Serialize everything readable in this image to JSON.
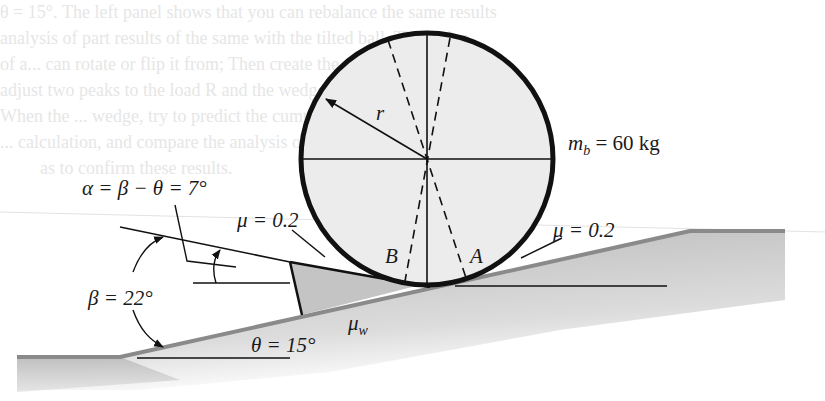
{
  "figure": {
    "ball": {
      "radius_label": "r",
      "mass_label_var": "m",
      "mass_label_sub": "b",
      "mass_label_value": "= 60 kg",
      "contact_point_left": "B",
      "contact_point_right": "A",
      "fill_color": "#ececec",
      "outline_color": "#111111"
    },
    "wedge": {
      "fill_color": "#c4c4c4",
      "friction_top_label": "μ = 0.2",
      "friction_bottom_var": "μ",
      "friction_bottom_sub": "w"
    },
    "incline": {
      "friction_label": "μ = 0.2",
      "theta_label": "θ = 15°",
      "surface_color": "#8a8a8a",
      "shade_color": "#bdbdbd"
    },
    "angles": {
      "alpha_label": "α = β − θ = 7°",
      "beta_label": "β = 22°"
    }
  },
  "background_text_lines": [
    "θ = 15°. The left panel shows that you can rebalance the same results",
    "analysis of part results of the same with the tilted ball. The active",
    "of a... can rotate or flip it from; Then create the cumulative model, and",
    "adjust two peaks to the load R and the wedge mark, and add a reaction.",
    "When the ... wedge, try to predict the cumulative value in the ...",
    "... calculation, and compare the analysis of the ball and determine",
    "as to confirm these results."
  ]
}
